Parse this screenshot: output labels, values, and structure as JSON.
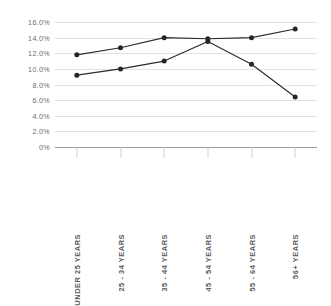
{
  "chart_data": {
    "type": "line",
    "title": "",
    "subtitle": "",
    "xlabel": "",
    "ylabel": "",
    "ylim": [
      0,
      16
    ],
    "grid": true,
    "legend": "none",
    "categories": [
      "UNDER 25 YEARS",
      "25 - 34 YEARS",
      "35 - 44 YEARS",
      "45 - 54 YEARS",
      "55 - 64 YEARS",
      "56+ YEARS"
    ],
    "ytick_labels": [
      "16.0%",
      "14.0%",
      "12.0%",
      "10.0%",
      "8.0%",
      "6.0%",
      "4.0%",
      "2.0%",
      "0%"
    ],
    "ytick_values": [
      16,
      14,
      12,
      10,
      8,
      6,
      4,
      2,
      0
    ],
    "series": [
      {
        "name": "Series 1",
        "color": "#2b2b2b",
        "values": [
          11.8,
          12.7,
          14.0,
          13.85,
          14.0,
          15.1
        ]
      },
      {
        "name": "Series 2",
        "color": "#2b2b2b",
        "values": [
          9.2,
          10.0,
          11.0,
          13.5,
          10.6,
          6.4
        ]
      }
    ]
  },
  "axis": {
    "grid_color": "#e2e2e2",
    "baseline_color": "#9a9a9a",
    "tick_color": "#cfcfcf",
    "label_color": "#6d6d6d",
    "category_label_color": "#5b5b5b"
  }
}
